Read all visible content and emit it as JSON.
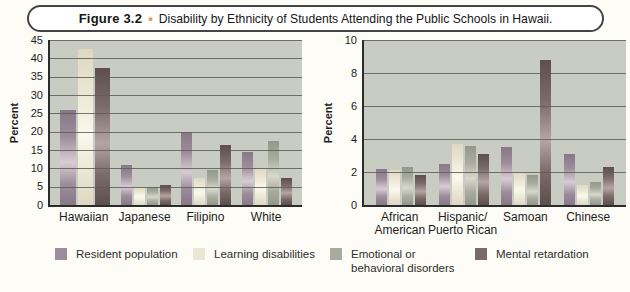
{
  "figure": {
    "label": "Figure 3.2",
    "bullet": "•",
    "title": "Disability by Ethnicity of Students Attending the Public Schools in Hawaii."
  },
  "legend": [
    {
      "label": "Resident population",
      "color_dark": "#887888",
      "color": "#9d8d9b",
      "color_light": "#d8ccd4"
    },
    {
      "label": "Learning disabilities",
      "color_dark": "#ded8c2",
      "color": "#ece7d5",
      "color_light": "#faf8ee"
    },
    {
      "label": "Emotional or behavioral disorders",
      "color_dark": "#94988a",
      "color": "#a8ac9e",
      "color_light": "#d6d8cc"
    },
    {
      "label": "Mental retardation",
      "color_dark": "#5e4f4e",
      "color": "#7a6a68",
      "color_light": "#b4a5a3"
    }
  ],
  "chart_data": [
    {
      "type": "bar",
      "ylabel": "Percent",
      "ylim": [
        0,
        45
      ],
      "ystep": 5,
      "grid": true,
      "legend_position": "bottom",
      "series_names": [
        "Resident population",
        "Learning disabilities",
        "Emotional or behavioral disorders",
        "Mental retardation"
      ],
      "categories": [
        "Hawaiian",
        "Japanese",
        "Filipino",
        "White"
      ],
      "groups": [
        {
          "category": "Hawaiian",
          "label_lines": [
            "Hawaiian"
          ],
          "values": [
            26,
            42.5,
            null,
            37.5
          ]
        },
        {
          "category": "Japanese",
          "label_lines": [
            "Japanese"
          ],
          "values": [
            11,
            5,
            5,
            5.5
          ]
        },
        {
          "category": "Filipino",
          "label_lines": [
            "Filipino"
          ],
          "values": [
            20,
            7.5,
            9.5,
            16.5
          ]
        },
        {
          "category": "White",
          "label_lines": [
            "White"
          ],
          "values": [
            14.5,
            10,
            17.5,
            7.5
          ]
        }
      ]
    },
    {
      "type": "bar",
      "ylabel": "Percent",
      "ylim": [
        0,
        10
      ],
      "ystep": 2,
      "grid": true,
      "legend_position": "bottom",
      "series_names": [
        "Resident population",
        "Learning disabilities",
        "Emotional or behavioral disorders",
        "Mental retardation"
      ],
      "categories": [
        "African American",
        "Hispanic/Puerto Rican",
        "Samoan",
        "Chinese"
      ],
      "groups": [
        {
          "category": "African American",
          "label_lines": [
            "African",
            "American"
          ],
          "values": [
            2.2,
            2.1,
            2.3,
            1.8
          ]
        },
        {
          "category": "Hispanic/Puerto Rican",
          "label_lines": [
            "Hispanic/",
            "Puerto Rican"
          ],
          "values": [
            2.5,
            3.7,
            3.6,
            3.1
          ]
        },
        {
          "category": "Samoan",
          "label_lines": [
            "Samoan"
          ],
          "values": [
            3.5,
            2.0,
            1.8,
            8.8
          ]
        },
        {
          "category": "Chinese",
          "label_lines": [
            "Chinese"
          ],
          "values": [
            3.1,
            1.2,
            1.4,
            2.3
          ]
        }
      ]
    }
  ]
}
